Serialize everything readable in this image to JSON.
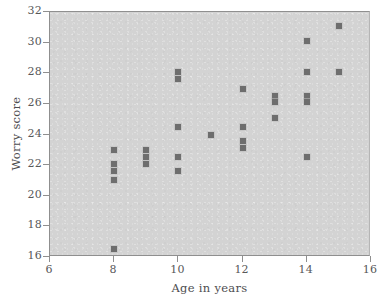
{
  "chart_data": {
    "type": "scatter",
    "title": "",
    "xlabel": "Age in years",
    "ylabel": "Worry score",
    "xlim": [
      6,
      16
    ],
    "ylim": [
      16,
      32
    ],
    "xticks": [
      6,
      8,
      10,
      12,
      14,
      16
    ],
    "yticks": [
      16,
      18,
      20,
      22,
      24,
      26,
      28,
      30,
      32
    ],
    "xtick_labels": [
      "6",
      "8",
      "10",
      "12",
      "14",
      "16"
    ],
    "ytick_labels": [
      "16",
      "18",
      "20",
      "22",
      "24",
      "26",
      "28",
      "30",
      "32"
    ],
    "grid": false,
    "legend": null,
    "marker": "square",
    "marker_color": "#6e6e6e",
    "panel_color": "#d3d3d3",
    "points": [
      {
        "x": 8,
        "y": 23.0
      },
      {
        "x": 8,
        "y": 22.1
      },
      {
        "x": 8,
        "y": 21.6
      },
      {
        "x": 8,
        "y": 21.0
      },
      {
        "x": 8,
        "y": 16.5
      },
      {
        "x": 9,
        "y": 23.0
      },
      {
        "x": 9,
        "y": 22.5
      },
      {
        "x": 9,
        "y": 22.1
      },
      {
        "x": 10,
        "y": 28.1
      },
      {
        "x": 10,
        "y": 27.6
      },
      {
        "x": 10,
        "y": 24.5
      },
      {
        "x": 10,
        "y": 22.5
      },
      {
        "x": 10,
        "y": 21.6
      },
      {
        "x": 11,
        "y": 24.0
      },
      {
        "x": 12,
        "y": 27.0
      },
      {
        "x": 12,
        "y": 24.5
      },
      {
        "x": 12,
        "y": 23.6
      },
      {
        "x": 12,
        "y": 23.1
      },
      {
        "x": 13,
        "y": 26.5
      },
      {
        "x": 13,
        "y": 26.1
      },
      {
        "x": 13,
        "y": 25.1
      },
      {
        "x": 14,
        "y": 30.1
      },
      {
        "x": 14,
        "y": 28.1
      },
      {
        "x": 14,
        "y": 26.5
      },
      {
        "x": 14,
        "y": 26.1
      },
      {
        "x": 14,
        "y": 22.5
      },
      {
        "x": 15,
        "y": 31.1
      },
      {
        "x": 15,
        "y": 28.1
      }
    ]
  }
}
